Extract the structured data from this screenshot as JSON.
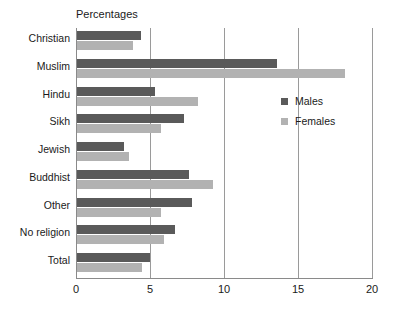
{
  "chart_data": {
    "type": "bar",
    "orientation": "horizontal",
    "title": "Percentages",
    "xlabel": "",
    "ylabel": "",
    "xlim": [
      0,
      20
    ],
    "xticks": [
      "0",
      "5",
      "10",
      "15",
      "20"
    ],
    "grid": true,
    "legend_position": "right",
    "categories": [
      "Christian",
      "Muslim",
      "Hindu",
      "Sikh",
      "Jewish",
      "Buddhist",
      "Other",
      "No religion",
      "Total"
    ],
    "series": [
      {
        "name": "Males",
        "color": "#5a5a5a",
        "values": [
          4.3,
          13.5,
          5.3,
          7.2,
          3.2,
          7.6,
          7.8,
          6.6,
          4.9
        ]
      },
      {
        "name": "Females",
        "color": "#b2b2b2",
        "values": [
          3.8,
          18.1,
          8.2,
          5.7,
          3.5,
          9.2,
          5.7,
          5.9,
          4.4
        ]
      }
    ]
  },
  "legend": {
    "items": [
      {
        "label": "Males"
      },
      {
        "label": "Females"
      }
    ]
  },
  "colors": {
    "males": "#5a5a5a",
    "females": "#b2b2b2",
    "axis": "#8a8a8a",
    "grid": "#9a9a9a",
    "text": "#1a1a1a",
    "background": "#ffffff"
  }
}
